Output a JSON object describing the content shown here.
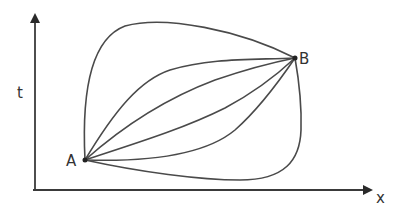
{
  "diagram": {
    "type": "spacetime-paths",
    "axes": {
      "vertical_label": "t",
      "horizontal_label": "x"
    },
    "points": {
      "start_label": "A",
      "end_label": "B"
    },
    "path_count": 6,
    "colors": {
      "stroke": "#4a4a4a",
      "background": "#ffffff"
    }
  }
}
